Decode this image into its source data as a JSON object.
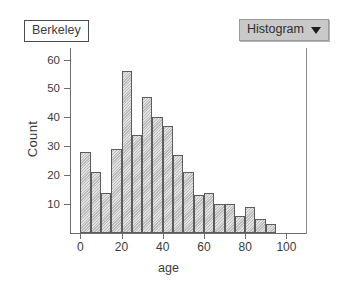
{
  "title_box": {
    "label": "Berkeley"
  },
  "dropdown": {
    "label": "Histogram",
    "caret_icon": "chevron-down-icon"
  },
  "colors": {
    "bar_fill": "#cacaca",
    "bar_stroke": "#5c5c5c",
    "axis": "#6e6e6e",
    "dropdown_bg": "#c9c9c9",
    "text": "#3c3c3c"
  },
  "chart_data": {
    "type": "bar",
    "title": "Berkeley",
    "xlabel": "age",
    "ylabel": "Count",
    "xlim": [
      -5,
      110
    ],
    "ylim": [
      0,
      64
    ],
    "grid": false,
    "legend": "none",
    "bin_width": 5,
    "x_ticks": [
      0,
      20,
      40,
      60,
      80,
      100
    ],
    "y_ticks": [
      10,
      20,
      30,
      40,
      50,
      60
    ],
    "bin_starts": [
      0,
      5,
      10,
      15,
      20,
      25,
      30,
      35,
      40,
      45,
      50,
      55,
      60,
      65,
      70,
      75,
      80,
      85,
      90
    ],
    "categories": [
      "0-5",
      "5-10",
      "10-15",
      "15-20",
      "20-25",
      "25-30",
      "30-35",
      "35-40",
      "40-45",
      "45-50",
      "50-55",
      "55-60",
      "60-65",
      "65-70",
      "70-75",
      "75-80",
      "80-85",
      "85-90",
      "90-95"
    ],
    "values": [
      28,
      21,
      14,
      29,
      56,
      34,
      47,
      40,
      37,
      27,
      21,
      13,
      14,
      10,
      10,
      6,
      9,
      5,
      3
    ]
  }
}
